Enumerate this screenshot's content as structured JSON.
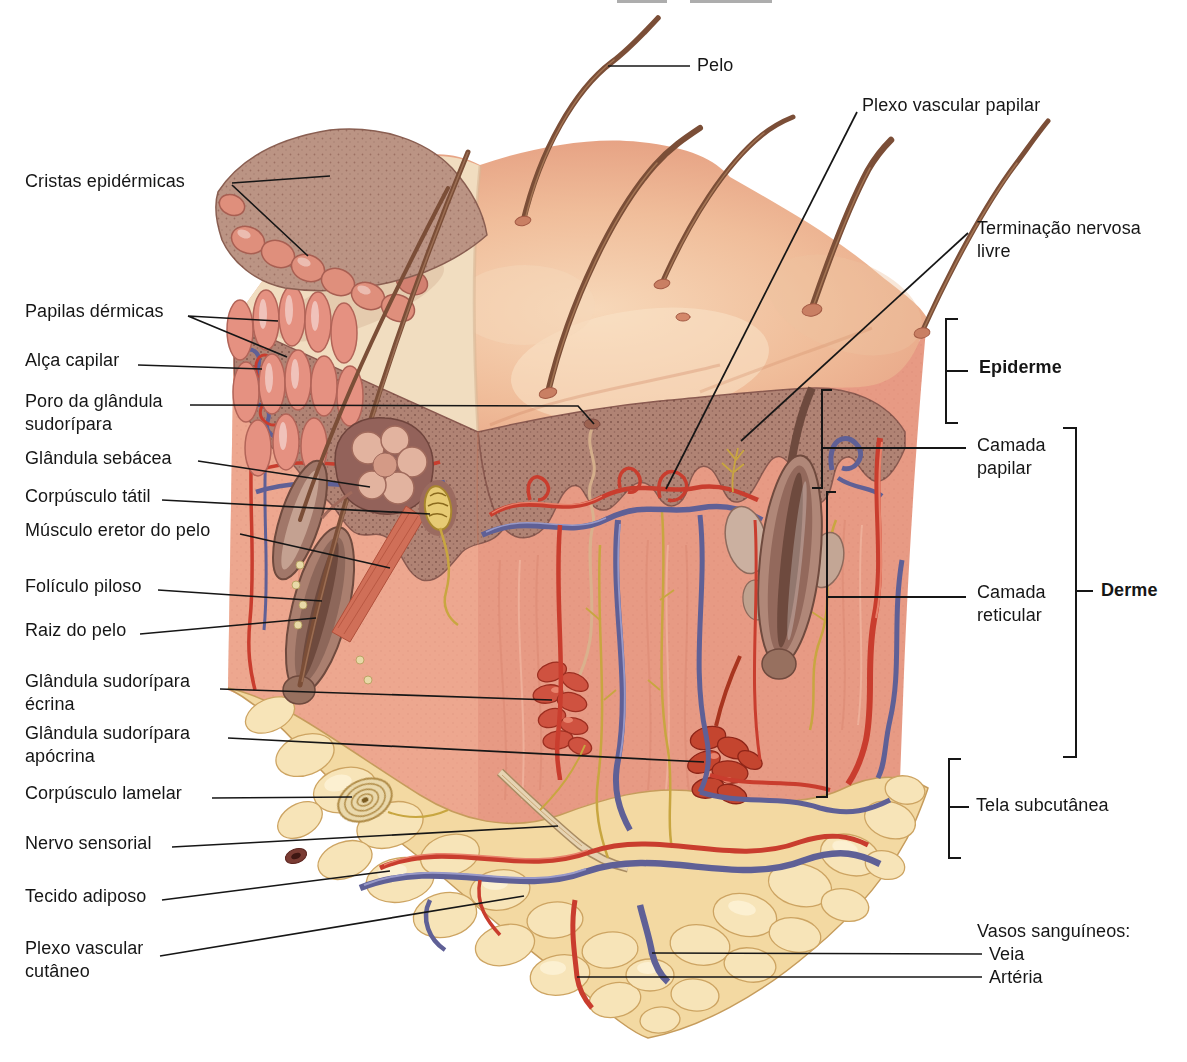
{
  "figure": {
    "language": "pt",
    "kind": "skin cross-section anatomical diagram"
  },
  "labels": [
    {
      "id": "cristas-epidermicas",
      "text": "Cristas epidérmicas"
    },
    {
      "id": "papilas-dermicas",
      "text": "Papilas dérmicas"
    },
    {
      "id": "alca-capilar",
      "text": "Alça capilar"
    },
    {
      "id": "poro-glandula-sudoripara",
      "text": "Poro da glândula\nsudorípara"
    },
    {
      "id": "glandula-sebacea",
      "text": "Glândula sebácea"
    },
    {
      "id": "corpusculo-tatil",
      "text": "Corpúsculo tátil"
    },
    {
      "id": "musculo-eretor-do-pelo",
      "text": "Músculo eretor do pelo"
    },
    {
      "id": "foliculo-piloso",
      "text": "Folículo piloso"
    },
    {
      "id": "raiz-do-pelo",
      "text": "Raiz do pelo"
    },
    {
      "id": "glandula-sudoripara-ecrina",
      "text": "Glândula sudorípara\nécrina"
    },
    {
      "id": "glandula-sudoripara-apocrina",
      "text": "Glândula sudorípara\napócrina"
    },
    {
      "id": "corpusculo-lamelar",
      "text": "Corpúsculo lamelar"
    },
    {
      "id": "nervo-sensorial",
      "text": "Nervo sensorial"
    },
    {
      "id": "tecido-adiposo",
      "text": "Tecido adiposo"
    },
    {
      "id": "plexo-vascular-cutaneo",
      "text": "Plexo vascular\ncutâneo"
    },
    {
      "id": "pelo",
      "text": "Pelo"
    },
    {
      "id": "plexo-vascular-papilar",
      "text": "Plexo vascular papilar"
    },
    {
      "id": "terminacao-nervosa-livre",
      "text": "Terminação nervosa\nlivre"
    },
    {
      "id": "epiderme",
      "text": "Epiderme"
    },
    {
      "id": "camada-papilar",
      "text": "Camada\npapilar"
    },
    {
      "id": "derme",
      "text": "Derme"
    },
    {
      "id": "camada-reticular",
      "text": "Camada\nreticular"
    },
    {
      "id": "tela-subcutanea",
      "text": "Tela subcutânea"
    },
    {
      "id": "vasos-sanguineos",
      "text": "Vasos sanguíneos:"
    },
    {
      "id": "veia",
      "text": "Veia"
    },
    {
      "id": "arteria",
      "text": "Artéria"
    }
  ],
  "palette": {
    "background": "#ffffff",
    "label_text": "#161616",
    "leader_line": "#161616",
    "skin_surface": "#efb493",
    "skin_highlight": "#f8dfc2",
    "epidermis_band": "#b08374",
    "dermis": "#e79a84",
    "subcutaneous_fat": "#f3d9a2",
    "fat_outline": "#c69c5c",
    "artery_red": "#c93d2e",
    "vein_blue": "#5f6096",
    "nerve_yellow": "#c8a640",
    "hair_brown": "#7b4e37"
  }
}
